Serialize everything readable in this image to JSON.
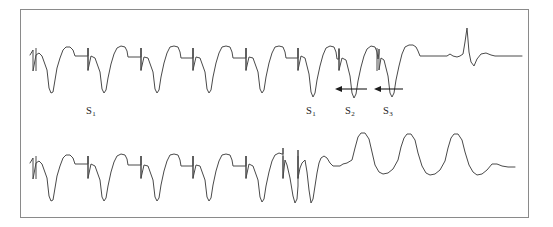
{
  "figure": {
    "kind": "ecg-strip-figure",
    "background_color": "#ffffff",
    "frame": {
      "name": "figure-border",
      "x": 20,
      "y": 9,
      "width": 509,
      "height": 209,
      "stroke_color": "#8a8a8a",
      "stroke_width": 1
    },
    "trace_color": "#4a4a4a",
    "arrow_color": "#1c1c1c",
    "label_color": "#1c1c1c"
  },
  "labels": [
    {
      "name": "label-s1-left",
      "text": "S",
      "subscript": "1",
      "x": 86,
      "y": 106
    },
    {
      "name": "label-s1-right",
      "text": "S",
      "subscript": "1",
      "x": 306,
      "y": 106
    },
    {
      "name": "label-s2",
      "text": "S",
      "subscript": "2",
      "x": 345,
      "y": 106
    },
    {
      "name": "label-s3",
      "text": "S",
      "subscript": "3",
      "x": 383,
      "y": 106
    }
  ],
  "arrows": [
    {
      "name": "arrow-s2-interval",
      "x_tail": 367,
      "x_tip": 335,
      "y": 89,
      "direction": "left"
    },
    {
      "name": "arrow-s3-interval",
      "x_tail": 403,
      "x_tip": 374,
      "y": 89,
      "direction": "left"
    }
  ],
  "chart_data": {
    "type": "line",
    "title": "",
    "xlabel": "",
    "ylabel": "",
    "grid": false,
    "legend": "none",
    "annotations": [
      "S1",
      "S1",
      "S2",
      "S3"
    ],
    "series": [
      {
        "name": "upper-trace",
        "description": "Paced drive train S1 with S2 and S3 extrastimuli terminating in restored sinus rhythm",
        "baseline_y": 62,
        "pacing_spike_x": [
          36,
          88,
          141,
          193,
          246,
          298,
          339,
          377
        ],
        "sinus_beat_x": 487,
        "points": "30,55 33,50 33,71 36,55 39,53 42,56 47,70 49,88 51,93 53,92 55,80 57,68 60,58 63,50 66,47 70,47 73,50 75,56 88,56 88,48 88,70 91,56 95,58 100,72 102,89 104,93 106,90 108,78 111,64 114,54 117,48 121,46 125,47 127,51 128,57 141,57 141,48 141,70 144,57 148,58 153,72 155,89 157,93 159,90 161,77 164,63 167,53 170,47 174,46 178,47 180,52 181,58 193,58 193,48 193,70 196,57 200,58 205,72 207,89 209,93 211,90 213,77 216,63 219,53 222,47 226,46 230,47 232,52 233,58 246,58 246,48 246,70 249,57 253,58 258,72 260,89 262,93 264,90 266,77 269,63 272,53 275,47 279,46 283,47 285,52 286,58 298,58 298,48 298,70 301,56 305,58 309,74 311,92 313,97 315,93 317,80 320,66 323,55 326,48 330,46 334,47 336,52 337,59 339,59 339,49 339,70 342,58 346,60 350,76 352,93 354,98 356,94 358,81 361,67 364,56 367,49 371,46 375,47 377,52 378,59 379,53 379,49 379,70 381,58 384,60 388,76 390,93 392,97 394,93 396,80 399,66 402,54 405,47 409,45 413,45 416,47 418,51 420,56 447,56 450,54 453,56 457,57 460,56 463,54 465,42 467,28 469,52 471,62 474,66 477,59 481,54 486,53 491,55 495,56 522,56"
      },
      {
        "name": "lower-trace",
        "description": "Same drive train degenerating into wide complex ventricular tachycardia",
        "baseline_y": 170,
        "pacing_spike_x": [
          36,
          88,
          141,
          193,
          246,
          283,
          298
        ],
        "points": "30,163 33,158 33,179 36,163 39,161 42,164 47,178 49,196 51,201 53,200 55,188 57,176 60,166 63,158 66,155 70,155 73,158 75,164 88,164 88,156 88,178 91,164 95,166 100,180 102,197 104,201 106,198 108,186 111,172 114,162 117,156 121,154 125,155 127,159 128,165 141,165 141,156 141,178 144,165 148,166 153,180 155,197 157,201 159,198 161,185 164,171 167,161 170,155 174,154 178,155 180,160 181,166 193,166 193,156 193,178 196,165 200,166 205,180 207,197 209,201 211,198 213,185 216,171 219,161 222,155 226,154 230,155 232,160 233,166 246,166 246,156 246,178 249,164 253,166 258,180 260,197 262,202 264,199 266,186 269,172 272,161 275,155 279,153 282,154 283,154 283,148 283,178 285,160 287,165 290,178 293,196 295,203 297,199 298,186 298,150 298,178 300,168 302,163 305,160 307,172 309,190 311,203 313,199 315,186 317,173 319,163 321,158 324,156 327,158 330,163 333,166 340,166 343,164 347,163 352,160 355,148 358,137 361,133 365,133 369,139 372,152 375,165 379,172 383,174 388,173 393,169 398,160 401,147 404,138 407,134 411,134 415,140 418,153 422,166 426,173 430,175 435,174 440,170 445,161 448,148 451,138 454,134 458,134 462,140 465,152 469,165 473,172 477,175 482,174 487,170 492,164 497,164 502,166 508,167 515,167"
      }
    ]
  }
}
